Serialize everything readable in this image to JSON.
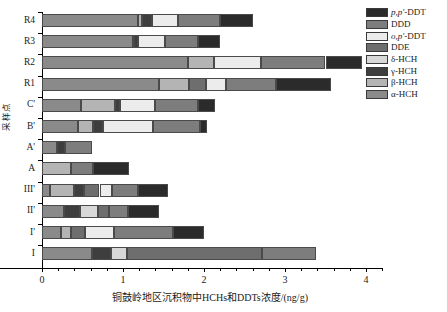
{
  "chart_data": {
    "type": "bar",
    "orientation": "horizontal",
    "stacked": true,
    "title": "",
    "xlabel": "铜鼓岭地区沉积物中HCHs和DDTs浓度/(ng/g)",
    "ylabel": "采样点",
    "xlim": [
      0,
      4.2
    ],
    "xticks": [
      0,
      1,
      2,
      3,
      4
    ],
    "xtick_labels": [
      "0",
      "1",
      "2",
      "3",
      "4"
    ],
    "grid": false,
    "legend_position": "top-right",
    "categories": [
      "R4",
      "R3",
      "R2",
      "R1",
      "C'",
      "B'",
      "A'",
      "A",
      "III'",
      "II'",
      "I'",
      "I"
    ],
    "series": [
      {
        "name": "α-HCH",
        "color": "#8a8a8a",
        "values": [
          1.18,
          1.12,
          1.8,
          1.45,
          0.48,
          0.45,
          0.18,
          0.0,
          0.1,
          0.27,
          0.24,
          0.62
        ]
      },
      {
        "name": "β-HCH",
        "color": "#b4b4b4",
        "values": [
          0.06,
          0.02,
          0.32,
          0.36,
          0.42,
          0.18,
          0.0,
          0.36,
          0.3,
          0.0,
          0.12,
          0.0
        ]
      },
      {
        "name": "γ-HCH",
        "color": "#3e3e3e",
        "values": [
          0.12,
          0.05,
          0.0,
          0.0,
          0.06,
          0.12,
          0.1,
          0.0,
          0.12,
          0.2,
          0.0,
          0.23
        ]
      },
      {
        "name": "δ-HCH",
        "color": "#d8d8d8",
        "values": [
          0.0,
          0.0,
          0.0,
          0.0,
          0.0,
          0.0,
          0.0,
          0.0,
          0.0,
          0.22,
          0.0,
          0.2
        ]
      },
      {
        "name": "DDE",
        "color": "#6e6e6e",
        "values": [
          0.0,
          0.0,
          0.0,
          0.22,
          0.0,
          0.0,
          0.0,
          0.0,
          0.19,
          0.14,
          0.17,
          1.67
        ]
      },
      {
        "name": "o,p'-DDT",
        "color": "#ececec",
        "values": [
          0.32,
          0.33,
          0.58,
          0.24,
          0.44,
          0.62,
          0.0,
          0.0,
          0.15,
          0.0,
          0.36,
          0.0
        ]
      },
      {
        "name": "DDD",
        "color": "#7d7d7d",
        "values": [
          0.52,
          0.4,
          0.8,
          0.62,
          0.52,
          0.58,
          0.34,
          0.27,
          0.32,
          0.23,
          0.73,
          0.66
        ]
      },
      {
        "name": "p,p'-DDT",
        "color": "#2b2b2b",
        "values": [
          0.4,
          0.28,
          0.45,
          0.68,
          0.22,
          0.09,
          0.0,
          0.45,
          0.37,
          0.39,
          0.38,
          0.0
        ]
      }
    ],
    "totals": [
      2.6,
      2.2,
      3.95,
      3.57,
      2.14,
      2.04,
      0.62,
      1.08,
      1.55,
      1.45,
      2.0,
      3.38
    ],
    "legend_entries": [
      {
        "label_html": "<i>p,p'</i>-DDT",
        "label": "p,p'-DDT",
        "color": "#2b2b2b"
      },
      {
        "label_html": "DDD",
        "label": "DDD",
        "color": "#7d7d7d"
      },
      {
        "label_html": "<i>o,p'</i>-DDT",
        "label": "o,p'-DDT",
        "color": "#ececec"
      },
      {
        "label_html": "DDE",
        "label": "DDE",
        "color": "#6e6e6e"
      },
      {
        "label_html": "δ-HCH",
        "label": "δ-HCH",
        "color": "#d8d8d8"
      },
      {
        "label_html": "γ-HCH",
        "label": "γ-HCH",
        "color": "#3e3e3e"
      },
      {
        "label_html": "β-HCH",
        "label": "β-HCH",
        "color": "#b4b4b4"
      },
      {
        "label_html": "α-HCH",
        "label": "α-HCH",
        "color": "#8a8a8a"
      }
    ]
  }
}
